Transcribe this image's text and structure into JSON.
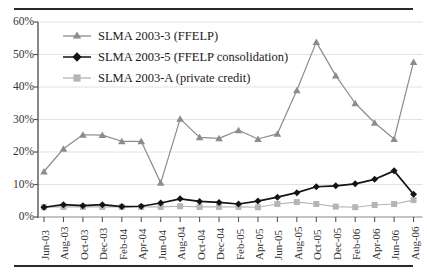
{
  "chart_data": {
    "type": "line",
    "title": "",
    "xlabel": "",
    "ylabel": "",
    "ylim": [
      0,
      60
    ],
    "ytick_labels": [
      "0%",
      "10%",
      "20%",
      "30%",
      "40%",
      "50%",
      "60%"
    ],
    "ytick_values": [
      0,
      10,
      20,
      30,
      40,
      50,
      60
    ],
    "grid": "horizontal",
    "legend_position": "upper-left-inside",
    "categories": [
      "Jun-03",
      "Aug-03",
      "Oct-03",
      "Dec-03",
      "Feb-04",
      "Apr-04",
      "Jun-04",
      "Aug-04",
      "Oct-04",
      "Dec-04",
      "Feb-05",
      "Apr-05",
      "Jun-05",
      "Aug-05",
      "Oct-05",
      "Dec-05",
      "Feb-06",
      "Apr-06",
      "Jun-06",
      "Aug-06"
    ],
    "series": [
      {
        "name": "SLMA 2003-3 (FFELP)",
        "marker": "triangle",
        "color": "#8c8c8c",
        "values": [
          14.0,
          21.0,
          25.3,
          25.2,
          23.3,
          23.3,
          10.5,
          30.2,
          24.5,
          24.2,
          26.7,
          24.0,
          25.6,
          39.0,
          53.8,
          43.5,
          35.0,
          29.0,
          24.0,
          47.7
        ]
      },
      {
        "name": "SLMA 2003-5 (FFELP consolidation)",
        "marker": "diamond",
        "color": "#141414",
        "values": [
          3.0,
          3.8,
          3.5,
          3.8,
          3.2,
          3.3,
          4.3,
          5.6,
          4.8,
          4.5,
          4.0,
          4.9,
          6.1,
          7.5,
          9.3,
          9.6,
          10.2,
          11.6,
          14.2,
          7.0
        ]
      },
      {
        "name": "SLMA 2003-A (private credit)",
        "marker": "square",
        "color": "#b5b5b5",
        "values": [
          3.0,
          3.1,
          3.1,
          3.1,
          3.1,
          3.1,
          3.1,
          3.3,
          3.1,
          3.1,
          3.1,
          3.0,
          4.0,
          4.6,
          4.0,
          3.2,
          3.0,
          3.7,
          4.0,
          5.2
        ]
      }
    ]
  },
  "legend": {
    "items": [
      {
        "label": "SLMA 2003-3 (FFELP)"
      },
      {
        "label": "SLMA 2003-5 (FFELP consolidation)"
      },
      {
        "label": "SLMA 2003-A (private credit)"
      }
    ]
  }
}
